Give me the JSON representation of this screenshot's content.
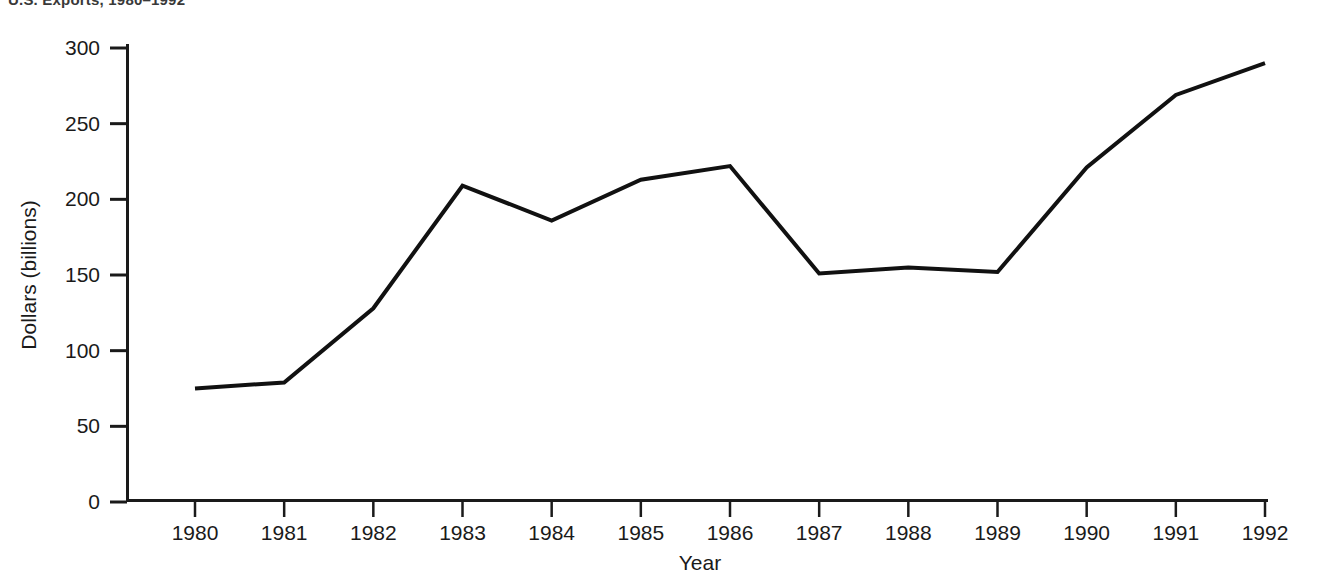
{
  "figure": {
    "clipped_header_text": "U.S. Exports, 1980–1992",
    "background_color": "#ffffff",
    "line_color": "#111111",
    "axis_color": "#1a1a1a"
  },
  "chart_data": {
    "type": "line",
    "title": "",
    "xlabel": "Year",
    "ylabel": "Dollars (billions)",
    "categories": [
      "1980",
      "1981",
      "1982",
      "1983",
      "1984",
      "1985",
      "1986",
      "1987",
      "1988",
      "1989",
      "1990",
      "1991",
      "1992"
    ],
    "x": [
      1980,
      1981,
      1982,
      1983,
      1984,
      1985,
      1986,
      1987,
      1988,
      1989,
      1990,
      1991,
      1992
    ],
    "values": [
      75,
      79,
      128,
      209,
      186,
      213,
      222,
      151,
      155,
      152,
      221,
      269,
      290
    ],
    "series": [
      {
        "name": "Dollars (billions)",
        "values": [
          75,
          79,
          128,
          209,
          186,
          213,
          222,
          151,
          155,
          152,
          221,
          269,
          290
        ]
      }
    ],
    "ylim": [
      0,
      300
    ],
    "yticks": [
      0,
      50,
      100,
      150,
      200,
      250,
      300
    ],
    "ytick_labels": [
      "0",
      "50",
      "100",
      "150",
      "200",
      "250",
      "300"
    ],
    "xtick_labels": [
      "1980",
      "1981",
      "1982",
      "1983",
      "1984",
      "1985",
      "1986",
      "1987",
      "1988",
      "1989",
      "1990",
      "1991",
      "1992"
    ],
    "grid": false,
    "legend": false,
    "legend_position": "none",
    "markers": false,
    "line_width": 4,
    "annotations": []
  }
}
